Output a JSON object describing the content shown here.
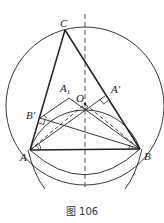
{
  "figure": {
    "caption": "图 106",
    "points": {
      "C": {
        "label": "C",
        "x": 65,
        "y": 30
      },
      "A": {
        "label": "A",
        "x": 30,
        "y": 150
      },
      "B": {
        "label": "B",
        "x": 140,
        "y": 149
      },
      "A_prime": {
        "label": "A′",
        "x": 105,
        "y": 96
      },
      "B_prime": {
        "label": "B′",
        "x": 40,
        "y": 118
      },
      "A1": {
        "label": "A",
        "sub": "1",
        "x": 69,
        "y": 98
      },
      "O": {
        "label": "O",
        "x": 85,
        "y": 104
      }
    },
    "colors": {
      "stroke": "#222222",
      "background": "#ffffff"
    }
  }
}
